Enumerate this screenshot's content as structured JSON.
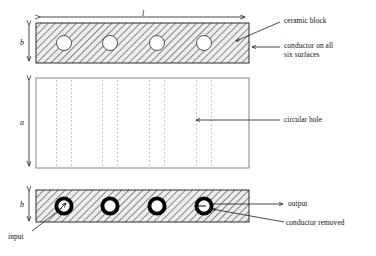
{
  "figure": {
    "type": "engineering-diagram",
    "views": [
      {
        "name": "top-view",
        "fill": "hatched",
        "holes": 4,
        "hole_style": "plain-circle"
      },
      {
        "name": "side-view",
        "fill": "white",
        "holes": 4,
        "hole_style": "dotted-projection"
      },
      {
        "name": "bottom-view",
        "fill": "hatched",
        "holes": 4,
        "hole_style": "thick-ring"
      }
    ]
  },
  "dimensions": {
    "length": "l",
    "width_top": "b",
    "height": "a",
    "width_bottom": "b"
  },
  "annotations": {
    "ceramic_block": "ceramic block",
    "conductor_surfaces_line1": "conductor on all",
    "conductor_surfaces_line2": "six surfaces",
    "circular_hole": "circular hole",
    "output": "output",
    "conductor_removed": "conductor removed",
    "input": "input"
  },
  "colors": {
    "line": "#1a1a1a",
    "hatch": "#555555",
    "block_tint": "#e9e9e9",
    "dotted": "#9a9a9a",
    "ring": "#000000",
    "hole_fill": "#ffffff"
  },
  "geometry": {
    "block_left": 36,
    "block_right": 249,
    "top_block": {
      "y": 23,
      "h": 40
    },
    "mid_block": {
      "y": 78,
      "h": 90
    },
    "bot_block": {
      "y": 190,
      "h": 32
    },
    "hole_centers_x": [
      64,
      110,
      157,
      204
    ],
    "top_hole_r": 7.5,
    "bot_hole_r_outer": 9.5,
    "bot_hole_r_inner": 5.6
  }
}
